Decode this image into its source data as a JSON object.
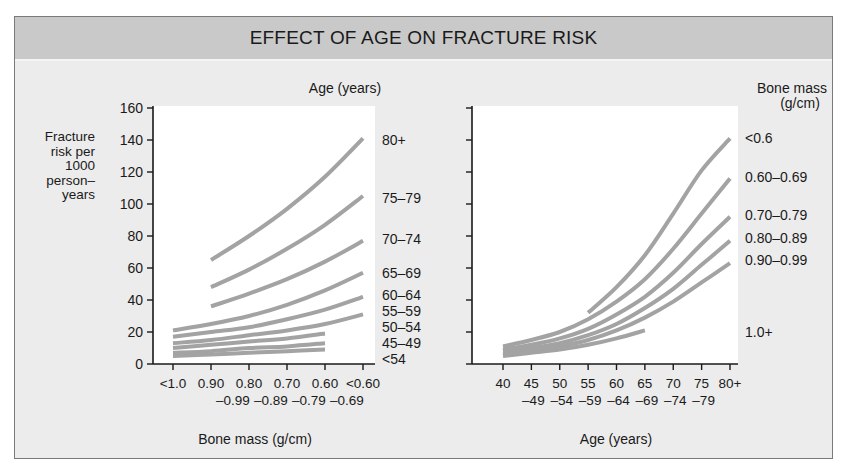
{
  "figure": {
    "title": "EFFECT OF AGE ON FRACTURE RISK",
    "colors": {
      "header_bg": "#c9c9c9",
      "panel_bg": "#ececec",
      "plot_bg": "#ffffff",
      "curve": "#a3a3a3",
      "axis": "#1a1a1a"
    }
  },
  "chart_data": [
    {
      "type": "line",
      "title": "",
      "ylabel": "Fracture risk per 1000 person–years",
      "ylabel_lines": [
        "Fracture",
        "risk per",
        "1000",
        "person–",
        "years"
      ],
      "xlabel": "Bone mass (g/cm)",
      "legend_title": "Age (years)",
      "legend_position": "right",
      "ylim": [
        0,
        160
      ],
      "yticks": [
        0,
        20,
        40,
        60,
        80,
        100,
        120,
        140,
        160
      ],
      "grid": false,
      "categories": [
        "<1.0",
        "0.90–0.99",
        "0.80–0.89",
        "0.70–0.79",
        "0.60–0.69",
        "<0.60"
      ],
      "tick_labels": [
        [
          "<1.0",
          ""
        ],
        [
          "0.90",
          "–0.99"
        ],
        [
          "0.80",
          "–0.89"
        ],
        [
          "0.70",
          "–0.79"
        ],
        [
          "0.60",
          "–0.69"
        ],
        [
          "<0.60",
          ""
        ]
      ],
      "series": [
        {
          "name": "80+",
          "values": [
            null,
            65,
            80,
            97,
            117,
            141
          ]
        },
        {
          "name": "75–79",
          "values": [
            null,
            48,
            59,
            72,
            87,
            105
          ]
        },
        {
          "name": "70–74",
          "values": [
            null,
            36,
            44,
            53,
            64,
            77
          ]
        },
        {
          "name": "65–69",
          "values": [
            21,
            25,
            30,
            37,
            46,
            57
          ]
        },
        {
          "name": "60–64",
          "values": [
            17,
            20,
            23,
            28,
            34,
            42
          ]
        },
        {
          "name": "55–59",
          "values": [
            13,
            15,
            18,
            21,
            25,
            31
          ]
        },
        {
          "name": "50–54",
          "values": [
            10,
            12,
            14,
            16,
            19,
            null
          ]
        },
        {
          "name": "45–49",
          "values": [
            7,
            8,
            10,
            11,
            13,
            null
          ]
        },
        {
          "name": "<54",
          "values": [
            5,
            6,
            7,
            8,
            9,
            null
          ]
        }
      ],
      "legend_labels": [
        {
          "text": "80+",
          "y": 140
        },
        {
          "text": "75–79",
          "y": 104
        },
        {
          "text": "70–74",
          "y": 78
        },
        {
          "text": "65–69",
          "y": 57
        },
        {
          "text": "60–64",
          "y": 43
        },
        {
          "text": "55–59",
          "y": 33
        },
        {
          "text": "50–54",
          "y": 23
        },
        {
          "text": "45–49",
          "y": 13
        },
        {
          "text": "<54",
          "y": 3
        }
      ]
    },
    {
      "type": "line",
      "title": "",
      "xlabel": "Age (years)",
      "ylabel": "Fracture risk per 1000 person–years",
      "legend_title": "Bone mass (g/cm)",
      "legend_title_lines": [
        "Bone mass",
        "(g/cm)"
      ],
      "legend_position": "right",
      "ylim": [
        0,
        160
      ],
      "grid": false,
      "categories": [
        "40",
        "45–49",
        "50–54",
        "55–59",
        "60–64",
        "65–69",
        "70–74",
        "75–79",
        "80+"
      ],
      "tick_labels": [
        [
          "40",
          ""
        ],
        [
          "45",
          "–49"
        ],
        [
          "50",
          "–54"
        ],
        [
          "55",
          "–59"
        ],
        [
          "60",
          "–64"
        ],
        [
          "65",
          "–69"
        ],
        [
          "70",
          "–74"
        ],
        [
          "75",
          "–79"
        ],
        [
          "80+",
          ""
        ]
      ],
      "series": [
        {
          "name": "<0.6",
          "values": [
            null,
            null,
            null,
            32,
            48,
            68,
            94,
            121,
            141
          ]
        },
        {
          "name": "0.60–0.69",
          "values": [
            11,
            15,
            20,
            28,
            39,
            53,
            72,
            94,
            116
          ]
        },
        {
          "name": "0.70–0.79",
          "values": [
            9,
            12,
            16,
            22,
            31,
            42,
            57,
            75,
            92
          ]
        },
        {
          "name": "0.80–0.89",
          "values": [
            8,
            10,
            13,
            18,
            25,
            35,
            47,
            62,
            77
          ]
        },
        {
          "name": "0.90–0.99",
          "values": [
            6,
            8,
            11,
            15,
            21,
            29,
            39,
            51,
            63
          ]
        },
        {
          "name": "1.0+",
          "values": [
            5,
            7,
            9,
            12,
            16,
            21,
            null,
            null,
            null
          ]
        }
      ],
      "legend_labels": [
        {
          "text": "<0.6",
          "y": 141
        },
        {
          "text": "0.60–0.69",
          "y": 117
        },
        {
          "text": "0.70–0.79",
          "y": 93
        },
        {
          "text": "0.80–0.89",
          "y": 79
        },
        {
          "text": "0.90–0.99",
          "y": 65
        },
        {
          "text": "1.0+",
          "y": 20
        }
      ]
    }
  ]
}
